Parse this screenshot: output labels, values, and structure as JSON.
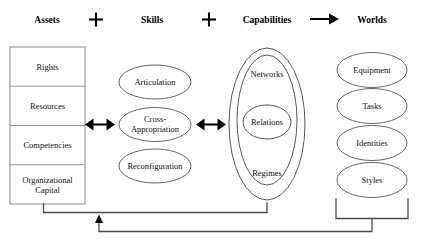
{
  "diagram": {
    "type": "conceptual-flow-diagram",
    "header": {
      "items": [
        {
          "label": "Assets",
          "x": 47
        },
        {
          "label": "Skills",
          "x": 152
        },
        {
          "label": "Capabilities",
          "x": 267
        },
        {
          "label": "Worlds",
          "x": 372
        }
      ],
      "connectors": [
        {
          "glyph": "plus",
          "name": "plus-sign",
          "x": 96
        },
        {
          "glyph": "plus",
          "name": "plus-sign",
          "x": 209
        },
        {
          "glyph": "arrow-right",
          "name": "arrow-right-icon",
          "x": 322
        }
      ]
    },
    "assets": {
      "name": "assets-box",
      "cells": [
        {
          "label": "Rights"
        },
        {
          "label": "Resources"
        },
        {
          "label": "Competencies"
        },
        {
          "label": "Organizational\nCapital",
          "line1": "Organizational",
          "line2": "Capital"
        }
      ]
    },
    "skills": {
      "name": "skills-group",
      "nodes": [
        {
          "label": "Articulation",
          "line1": "Articulation",
          "line2": ""
        },
        {
          "label": "Cross-Appropriation",
          "line1": "Cross-",
          "line2": "Appropriation"
        },
        {
          "label": "Reconfiguration",
          "line1": "Reconfiguration",
          "line2": ""
        }
      ]
    },
    "capabilities": {
      "name": "capabilities-group",
      "nested": [
        {
          "label": "Regimes",
          "level": "outer"
        },
        {
          "label": "Networks",
          "level": "middle"
        },
        {
          "label": "Relations",
          "level": "inner"
        }
      ]
    },
    "worlds": {
      "name": "worlds-group",
      "nodes": [
        {
          "label": "Equipment"
        },
        {
          "label": "Tasks"
        },
        {
          "label": "Identities"
        },
        {
          "label": "Styles"
        }
      ]
    },
    "relations": {
      "assets_skills_arrow": "bidirectional",
      "skills_capabilities_arrow": "bidirectional",
      "capabilities_worlds_arrow": "unidirectional",
      "feedback_loop": "worlds-back-to-assets-capabilities"
    },
    "colors": {
      "background": "#ffffff",
      "stroke": "#555555",
      "text": "#111111",
      "arrow": "#000000",
      "bracket": "#4a4a4a"
    }
  }
}
